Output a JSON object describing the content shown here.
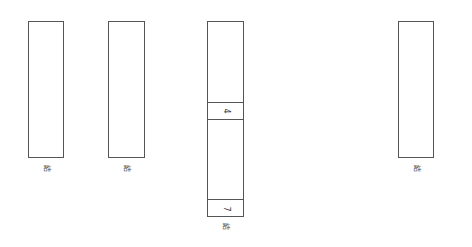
{
  "diagram": {
    "columns": [
      {
        "id": "col1",
        "label": "結",
        "box": {
          "x": 28,
          "y": 21,
          "w": 36,
          "h": 137
        },
        "dividers": [],
        "cells": []
      },
      {
        "id": "col2",
        "label": "結",
        "box": {
          "x": 108,
          "y": 21,
          "w": 37,
          "h": 137
        },
        "dividers": [],
        "cells": []
      },
      {
        "id": "col3",
        "label": "結",
        "box": {
          "x": 207,
          "y": 21,
          "w": 37,
          "h": 196
        },
        "dividers": [
          102,
          119,
          199
        ],
        "cells": [
          {
            "text": "4",
            "y": 110
          },
          {
            "text": "7",
            "y": 208
          }
        ]
      },
      {
        "id": "col4",
        "label": "結",
        "box": {
          "x": 398,
          "y": 21,
          "w": 36,
          "h": 137
        },
        "dividers": [],
        "cells": []
      }
    ],
    "stroke_color": "#555555",
    "background": "#ffffff"
  }
}
